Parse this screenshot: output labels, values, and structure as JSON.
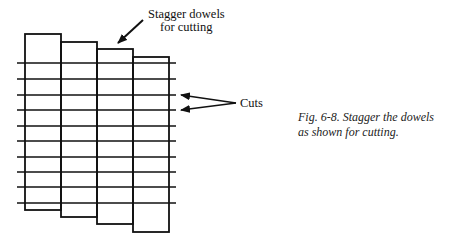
{
  "figure": {
    "top_label": {
      "line1": "Stagger dowels",
      "line2": "for cutting"
    },
    "cuts_label": "Cuts",
    "caption": {
      "line1": "Fig. 6-8. Stagger the dowels",
      "line2": "as shown for cutting."
    },
    "dowels": [
      {
        "x": 25,
        "top": 34,
        "width": 36,
        "bottom": 210
      },
      {
        "x": 61,
        "top": 42,
        "width": 36,
        "bottom": 217
      },
      {
        "x": 97,
        "top": 49,
        "width": 36,
        "bottom": 224
      },
      {
        "x": 133,
        "top": 57,
        "width": 36,
        "bottom": 232
      }
    ],
    "cut_lines_y": [
      63,
      79,
      95,
      110,
      126,
      141,
      157,
      172,
      187,
      203
    ],
    "cut_line_x_range": [
      17,
      176
    ],
    "line_color": "#111111"
  }
}
